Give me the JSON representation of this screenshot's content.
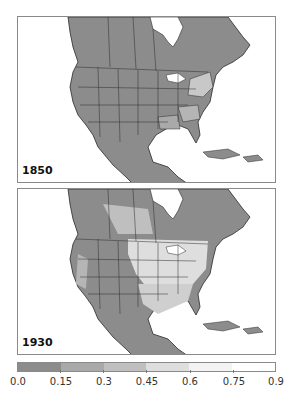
{
  "panels": [
    {
      "year_label": "1850",
      "description": "North America map, values mostly low (0.0-0.15) with lighter shading in eastern US states"
    },
    {
      "year_label": "1930",
      "description": "North America map, higher values (0.3-0.6) across US Midwest, Great Plains, South and parts of Canadian prairies"
    }
  ],
  "colorbar": {
    "ticks": [
      "0.0",
      "0.15",
      "0.3",
      "0.45",
      "0.6",
      "0.75",
      "0.9"
    ],
    "colors": [
      "#8c8c8c",
      "#a9a9a9",
      "#bfbfbf",
      "#dedede",
      "#f3f3f3",
      "#ffffff"
    ],
    "min": 0.0,
    "max": 0.9
  },
  "colors": {
    "land_base": "#8c8c8c",
    "border": "#2a2a2a",
    "water": "#ffffff",
    "frame": "#8a8a8a"
  }
}
